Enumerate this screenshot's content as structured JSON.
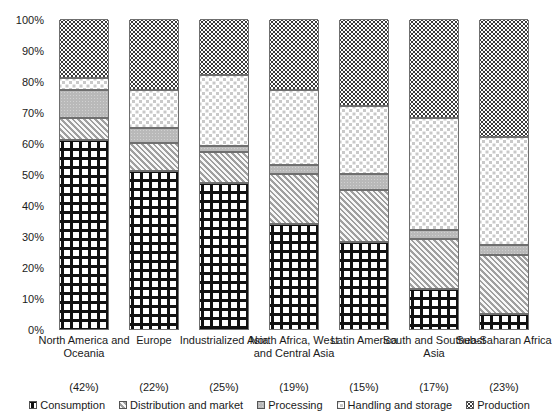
{
  "chart_data": {
    "type": "bar",
    "title": "",
    "subtitle": "",
    "xlabel": "",
    "ylabel": "",
    "ylim": [
      0,
      100
    ],
    "grid": false,
    "stacked": true,
    "legend_position": "bottom",
    "categories": [
      "North America and Oceania",
      "Europe",
      "Industrialized Asia",
      "North Africa, West and Central Asia",
      "Latin America",
      "South and Southeast Asia",
      "Sub-Saharan Africa"
    ],
    "category_sublabels": [
      "(42%)",
      "(22%)",
      "(25%)",
      "(19%)",
      "(15%)",
      "(17%)",
      "(23%)"
    ],
    "ytick_labels": [
      "100%",
      "90%",
      "80%",
      "70%",
      "60%",
      "50%",
      "40%",
      "30%",
      "20%",
      "10%",
      "0%"
    ],
    "ytick_values": [
      100,
      90,
      80,
      70,
      60,
      50,
      40,
      30,
      20,
      10,
      0
    ],
    "series": [
      {
        "name": "Consumption",
        "pattern": "dense-cross-hatch",
        "values": [
          61,
          51,
          47,
          34,
          28,
          13,
          5
        ]
      },
      {
        "name": "Distribution and market",
        "pattern": "diagonal-hatch",
        "values": [
          7,
          9,
          10,
          16,
          17,
          16,
          19
        ]
      },
      {
        "name": "Processing",
        "pattern": "solid-gray",
        "values": [
          9,
          5,
          2,
          3,
          5,
          3,
          3
        ]
      },
      {
        "name": "Handling and storage",
        "pattern": "light-dots",
        "values": [
          4,
          12,
          23,
          24,
          22,
          36,
          35
        ]
      },
      {
        "name": "Production",
        "pattern": "dark-dots",
        "values": [
          19,
          23,
          18,
          23,
          28,
          32,
          38
        ]
      }
    ],
    "cumulative_tops": [
      [
        61,
        68,
        77,
        81,
        100
      ],
      [
        51,
        60,
        65,
        77,
        100
      ],
      [
        47,
        57,
        59,
        82,
        100
      ],
      [
        34,
        50,
        53,
        77,
        100
      ],
      [
        28,
        45,
        50,
        72,
        100
      ],
      [
        13,
        29,
        32,
        68,
        100
      ],
      [
        5,
        24,
        27,
        62,
        100
      ]
    ]
  },
  "legend": {
    "items": [
      {
        "label": "Consumption"
      },
      {
        "label": "Distribution and market"
      },
      {
        "label": "Processing"
      },
      {
        "label": "Handling and storage"
      },
      {
        "label": "Production"
      }
    ]
  }
}
